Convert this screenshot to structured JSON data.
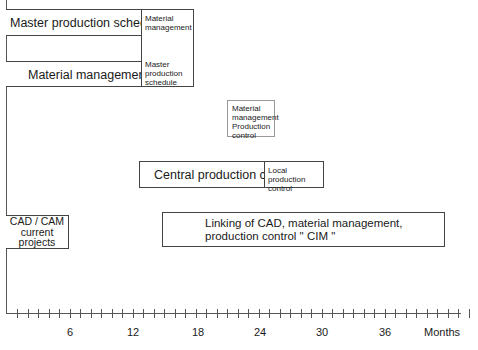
{
  "diagram": {
    "rows": [
      {
        "main_label": "Master production schedule",
        "side_label": "Material management"
      },
      {
        "main_label": "Material management",
        "side_label": "Master production schedule"
      }
    ],
    "material_production_box": "Material management Production control",
    "central_production": {
      "main_label": "Central production control",
      "side_label": "Local production control"
    },
    "cad_cam_box": "CAD / CAM current projects",
    "cim_box": "Linking of CAD, material management, production control \" CIM \""
  },
  "axis": {
    "ticks": [
      "6",
      "12",
      "18",
      "24",
      "30",
      "36"
    ],
    "unit_label": "Months"
  }
}
